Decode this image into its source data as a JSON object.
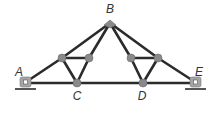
{
  "diagram": {
    "type": "roof-truss",
    "colors": {
      "member": "#2b2b2b",
      "joint": "#8a8a8a",
      "support": "#9a9a9a",
      "ground": "#555555",
      "label": "#333333"
    },
    "labels": {
      "A": "A",
      "B": "B",
      "C": "C",
      "D": "D",
      "E": "E"
    },
    "joints": {
      "A": [
        26,
        82
      ],
      "B": [
        110,
        23
      ],
      "C": [
        77,
        83
      ],
      "D": [
        143,
        83
      ],
      "E": [
        195,
        82
      ],
      "F": [
        62,
        58
      ],
      "G": [
        89,
        58
      ],
      "H": [
        131,
        58
      ],
      "I": [
        158,
        58
      ]
    },
    "members": [
      [
        "A",
        "F"
      ],
      [
        "F",
        "B"
      ],
      [
        "B",
        "I"
      ],
      [
        "I",
        "E"
      ],
      [
        "A",
        "C"
      ],
      [
        "C",
        "D"
      ],
      [
        "D",
        "E"
      ],
      [
        "F",
        "G"
      ],
      [
        "F",
        "C"
      ],
      [
        "G",
        "C"
      ],
      [
        "G",
        "B"
      ],
      [
        "H",
        "I"
      ],
      [
        "H",
        "D"
      ],
      [
        "I",
        "D"
      ],
      [
        "H",
        "B"
      ]
    ],
    "supports": [
      "A",
      "E"
    ]
  }
}
